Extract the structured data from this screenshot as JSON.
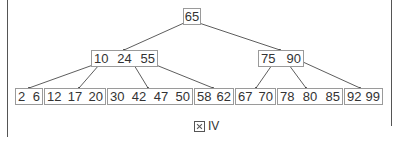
{
  "diagram": {
    "type": "b-tree",
    "colors": {
      "node_border": "#9a9a9a",
      "edge": "#333333",
      "frame": "#555555",
      "text": "#333333"
    },
    "root": {
      "keys": [
        "65"
      ]
    },
    "internal": [
      {
        "keys": [
          "10",
          "24",
          "55"
        ]
      },
      {
        "keys": [
          "75",
          "90"
        ]
      }
    ],
    "leaves": [
      {
        "keys": [
          "2",
          "6"
        ]
      },
      {
        "keys": [
          "12",
          "17",
          "20"
        ]
      },
      {
        "keys": [
          "30",
          "42",
          "47",
          "50"
        ]
      },
      {
        "keys": [
          "58",
          "62"
        ]
      },
      {
        "keys": [
          "67",
          "70"
        ]
      },
      {
        "keys": [
          "78",
          "80",
          "85"
        ]
      },
      {
        "keys": [
          "92",
          "99"
        ]
      }
    ],
    "caption": {
      "prefix": "図",
      "label": "IV"
    }
  }
}
